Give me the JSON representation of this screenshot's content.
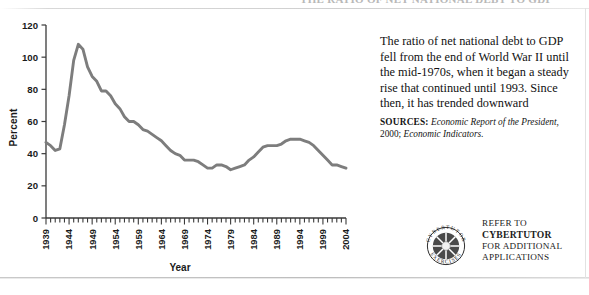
{
  "page": {
    "running_header": "THE RATIO OF NET NATIONAL DEBT TO GDP"
  },
  "chart_data": {
    "type": "line",
    "title": "",
    "xlabel": "Year",
    "ylabel": "Percent",
    "xlim": [
      1939,
      2004
    ],
    "ylim": [
      0,
      120
    ],
    "ytick_step": 20,
    "yticks": [
      "0",
      "20",
      "40",
      "60",
      "80",
      "100",
      "120"
    ],
    "xticks": [
      "1939",
      "1944",
      "1949",
      "1954",
      "1959",
      "1964",
      "1969",
      "1974",
      "1979",
      "1984",
      "1989",
      "1994",
      "1999",
      "2004"
    ],
    "xtick_step": 5,
    "minor_xtick_step": 1,
    "grid": false,
    "legend": null,
    "line_color": "#7d7d7d",
    "series": [
      {
        "name": "Net national debt as percent of GDP",
        "x": [
          1939,
          1940,
          1941,
          1942,
          1943,
          1944,
          1945,
          1946,
          1947,
          1948,
          1949,
          1950,
          1951,
          1952,
          1953,
          1954,
          1955,
          1956,
          1957,
          1958,
          1959,
          1960,
          1961,
          1962,
          1963,
          1964,
          1965,
          1966,
          1967,
          1968,
          1969,
          1970,
          1971,
          1972,
          1973,
          1974,
          1975,
          1976,
          1977,
          1978,
          1979,
          1980,
          1981,
          1982,
          1983,
          1984,
          1985,
          1986,
          1987,
          1988,
          1989,
          1990,
          1991,
          1992,
          1993,
          1994,
          1995,
          1996,
          1997,
          1998,
          1999,
          2000,
          2001,
          2002,
          2003,
          2004
        ],
        "values": [
          47,
          45,
          42,
          43,
          58,
          76,
          98,
          108,
          105,
          94,
          88,
          85,
          79,
          79,
          76,
          71,
          68,
          63,
          60,
          60,
          58,
          55,
          54,
          52,
          50,
          48,
          45,
          42,
          40,
          39,
          36,
          36,
          36,
          35,
          33,
          31,
          31,
          33,
          33,
          32,
          30,
          31,
          32,
          33,
          36,
          38,
          41,
          44,
          45,
          45,
          45,
          46,
          48,
          49,
          49,
          49,
          48,
          47,
          45,
          42,
          39,
          36,
          33,
          33,
          32,
          31
        ]
      }
    ],
    "annotations": [
      {
        "label": "wartime peak",
        "x": 1946,
        "y": 108
      },
      {
        "label": "post-war trough",
        "x": 1974,
        "y": 31
      },
      {
        "label": "secondary peak",
        "x": 1993,
        "y": 49
      }
    ]
  },
  "caption": {
    "body": "The ratio of net national debt to GDP fell from the end of World War II until the mid-1970s, when it began a steady rise that continued until 1993. Since then, it has trended downward"
  },
  "sources": {
    "label": "SOURCES:",
    "work1": "Economic Report of the President,",
    "year": "2000;",
    "work2": "Economic Indicators."
  },
  "badge": {
    "line1": "REFER TO",
    "line2": "CYBERTUTOR",
    "line3": "FOR ADDITIONAL",
    "line4": "APPLICATIONS",
    "mark_top_text": "CYBERTUTOR",
    "mark_bottom_text": "EXERCISES"
  }
}
